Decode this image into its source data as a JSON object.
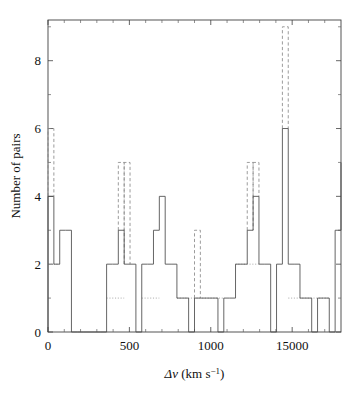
{
  "figure": {
    "background": "#ffffff",
    "ink": "#3f3f3f"
  },
  "chart_data": {
    "type": "bar",
    "title": "",
    "subtitle": "",
    "xlabel": "Δv (km s−1)",
    "xlabel_base": "Δv (km s",
    "xlabel_exponent": "−1",
    "xlabel_close": ")",
    "ylabel": "Number of pairs",
    "xlim": [
      0,
      1800
    ],
    "ylim": [
      0,
      9.2
    ],
    "xticks": [
      0,
      500,
      1000,
      1500
    ],
    "xticklabels": [
      "0",
      "500",
      "1000",
      "15000"
    ],
    "xminorticks": [
      100,
      200,
      300,
      400,
      600,
      700,
      800,
      900,
      1100,
      1200,
      1300,
      1400,
      1600,
      1700
    ],
    "yticks": [
      0,
      2,
      4,
      6,
      8
    ],
    "yticklabels": [
      "0",
      "2",
      "4",
      "6",
      "8"
    ],
    "yminorticks": [
      1,
      3,
      5,
      7,
      9
    ],
    "grid": false,
    "legend_position": "none",
    "bin_width": 36,
    "bin_edges": [
      0,
      36,
      72,
      108,
      144,
      180,
      216,
      252,
      288,
      324,
      360,
      396,
      432,
      468,
      504,
      540,
      576,
      612,
      648,
      684,
      720,
      756,
      792,
      828,
      864,
      900,
      936,
      972,
      1008,
      1044,
      1080,
      1116,
      1152,
      1188,
      1224,
      1260,
      1296,
      1332,
      1368,
      1404,
      1440,
      1476,
      1512,
      1548,
      1584,
      1620,
      1656,
      1692,
      1728,
      1764,
      1800
    ],
    "series": [
      {
        "name": "solid",
        "style": "solid",
        "values": [
          4,
          2,
          3,
          3,
          0,
          0,
          0,
          0,
          0,
          0,
          2,
          2,
          3,
          2,
          2,
          0,
          2,
          2,
          3,
          4,
          2,
          2,
          1,
          1,
          0,
          1,
          1,
          1,
          1,
          0,
          1,
          1,
          2,
          2,
          3,
          4,
          2,
          2,
          0,
          2,
          6,
          2,
          2,
          1,
          1,
          0,
          1,
          1,
          0,
          3,
          5
        ]
      },
      {
        "name": "dashed",
        "style": "dashed",
        "values": [
          6,
          5,
          5,
          3,
          5,
          9
        ]
      },
      {
        "name": "dotted",
        "style": "dotted",
        "values": [
          2,
          1,
          1,
          1,
          1,
          1
        ]
      }
    ]
  }
}
